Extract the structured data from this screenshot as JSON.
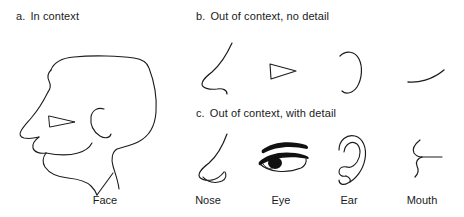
{
  "figure": {
    "background_color": "#ffffff",
    "ink_color": "#1c1c1c",
    "panels": [
      {
        "marker": "a.",
        "title": "In context",
        "id": "panel-a",
        "description": "line drawing of a face in profile facing left, containing eye, ear, nose and mouth"
      },
      {
        "marker": "b.",
        "title": "Out of context, no detail",
        "id": "panel-b",
        "description": "isolated facial features drawn as bare outlines"
      },
      {
        "marker": "c.",
        "title": "Out of context, with detail",
        "id": "panel-c",
        "description": "isolated facial features drawn with internal detail"
      }
    ],
    "columns": [
      {
        "id": "face",
        "label": "Face"
      },
      {
        "id": "nose",
        "label": "Nose"
      },
      {
        "id": "eye",
        "label": "Eye"
      },
      {
        "id": "ear",
        "label": "Ear"
      },
      {
        "id": "mouth",
        "label": "Mouth"
      }
    ],
    "items": {
      "face_profile": "face-profile-drawing",
      "nose_plain": "nose-outline-no-detail",
      "eye_plain": "eye-outline-no-detail",
      "ear_plain": "ear-outline-no-detail",
      "mouth_plain": "mouth-outline-no-detail",
      "nose_detail": "nose-drawing-with-detail",
      "eye_detail": "eye-drawing-with-detail",
      "ear_detail": "ear-drawing-with-detail",
      "mouth_detail": "mouth-drawing-with-detail"
    }
  }
}
